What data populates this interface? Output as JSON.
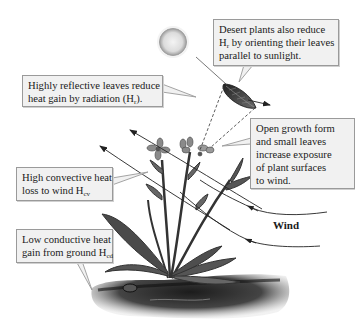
{
  "diagram": {
    "sun": {
      "label": "sun"
    },
    "callouts": {
      "desert_orientation": {
        "lines": [
          "Desert plants also reduce",
          "by orienting their leaves",
          "parallel to sunlight."
        ],
        "symbol": "H",
        "symbol_sub": "r"
      },
      "reflective_leaves": {
        "line1": "Highly reflective leaves reduce",
        "line2_prefix": "heat gain by radiation (",
        "symbol": "H",
        "symbol_sub": "r",
        "line2_suffix": ")."
      },
      "open_growth": {
        "lines": [
          "Open growth form",
          "and small leaves",
          "increase exposure",
          "of plant surfaces",
          "to wind."
        ]
      },
      "convective": {
        "line1": "High convective heat",
        "line2_prefix": "loss to wind ",
        "symbol": "H",
        "symbol_sub": "cv"
      },
      "conductive": {
        "line1": "Low conductive heat",
        "line2_prefix": "gain from ground ",
        "symbol": "H",
        "symbol_sub": "cd"
      }
    },
    "wind_label": "Wind",
    "colors": {
      "box_fill": "#f1f1f1",
      "box_border": "#9a9a9a",
      "line": "#333333",
      "plant": "#4a4a4a",
      "ground": "#2e2e2e"
    }
  }
}
